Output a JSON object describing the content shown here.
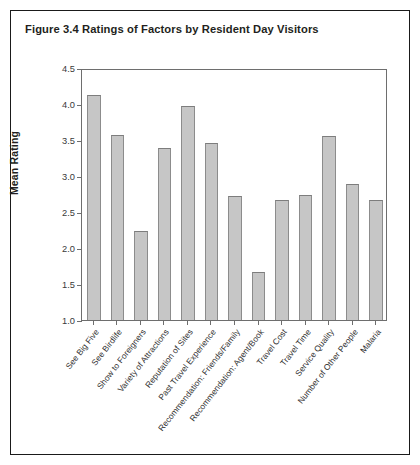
{
  "figure": {
    "title": "Figure 3.4  Ratings of Factors by Resident Day Visitors"
  },
  "chart_data": {
    "type": "bar",
    "title": "Figure 3.4  Ratings of Factors by Resident Day Visitors",
    "xlabel": "",
    "ylabel": "Mean Rating",
    "ylim": [
      1.0,
      4.5
    ],
    "yticks": [
      "1.0",
      "1.5",
      "2.0",
      "2.5",
      "3.0",
      "3.5",
      "4.0",
      "4.5"
    ],
    "ytick_values": [
      1.0,
      1.5,
      2.0,
      2.5,
      3.0,
      3.5,
      4.0,
      4.5
    ],
    "grid": false,
    "legend": null,
    "bar_color": "#c6c6c6",
    "bar_edge_color": "#8c8c8c",
    "categories": [
      "See Big Five",
      "See Birdlife",
      "Show to Foreigners",
      "Variety of Attractions",
      "Reputation of Sites",
      "Past Travel Experience",
      "Recommendation: Friends/Family",
      "Recommendation: Agent/Book",
      "Travel Cost",
      "Travel Time",
      "Service Quality",
      "Number of Other People",
      "Malaria"
    ],
    "values": [
      4.13,
      3.57,
      2.23,
      3.39,
      3.97,
      3.46,
      2.72,
      1.66,
      2.66,
      2.74,
      3.55,
      2.89,
      2.66
    ]
  }
}
